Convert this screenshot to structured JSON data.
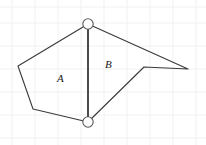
{
  "figure": {
    "canvas": {
      "width": 206,
      "height": 145,
      "background": "#ffffff"
    },
    "grid": {
      "visible": true,
      "color": "#f1f1f3",
      "stroke_width": 1,
      "x_lines": [
        12,
        35,
        58,
        81,
        104,
        127,
        150,
        173,
        196
      ],
      "y_lines": [
        7,
        23,
        46,
        69,
        92,
        115,
        138
      ]
    },
    "stroke": {
      "color": "#3a3a3a",
      "width": 1.1
    },
    "vertices": {
      "top": {
        "x": 88,
        "y": 24,
        "name": "top-node"
      },
      "bottom": {
        "x": 88,
        "y": 122,
        "name": "bottom-node"
      },
      "left_upper": {
        "x": 18,
        "y": 66,
        "name": "left-upper-vertex"
      },
      "left_lower": {
        "x": 33,
        "y": 109,
        "name": "left-lower-vertex"
      },
      "right_tip": {
        "x": 188,
        "y": 69,
        "name": "right-tip-vertex"
      },
      "notch": {
        "x": 144,
        "y": 67,
        "name": "notch-vertex"
      }
    },
    "polygon_A_points": "88,24 18,66 33,109 88,122",
    "polygon_B_points": "88,24 188,69 144,67 88,122",
    "divider_points": "88,24 88,122",
    "nodes": [
      {
        "id": "top",
        "cx": 88,
        "cy": 24,
        "r": 5.2,
        "fill": "#ffffff",
        "stroke": "#5a5a5a"
      },
      {
        "id": "bottom",
        "cx": 88,
        "cy": 122,
        "r": 5.2,
        "fill": "#ffffff",
        "stroke": "#5a5a5a"
      }
    ],
    "labels": {
      "region_a": "A",
      "region_b": "B"
    }
  }
}
